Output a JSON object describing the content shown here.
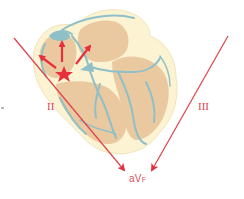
{
  "diagram": {
    "leads": {
      "ii": {
        "label": "II"
      },
      "iii": {
        "label": "III"
      },
      "avf": {
        "label": "aV",
        "subscript": "F"
      }
    },
    "colors": {
      "heart_outline": "#fbf3d2",
      "myocardium": "#eac9a0",
      "conduction": "#8fc0c8",
      "vector": "#e0404a",
      "label": "#e0404a"
    },
    "icons": [
      "sinus-node-star-icon",
      "depolarization-arrow-icon"
    ]
  }
}
